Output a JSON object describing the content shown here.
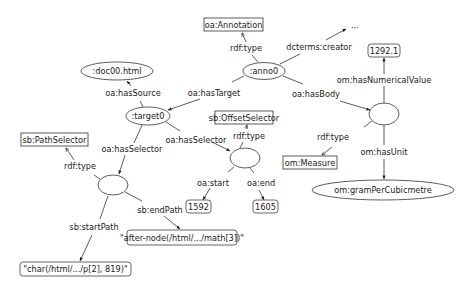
{
  "diagram": {
    "type": "rdf-graph",
    "nodes": {
      "annotation_class": {
        "label": "oa:Annotation",
        "shape": "rect"
      },
      "anno0": {
        "label": ":anno0",
        "shape": "ellipse"
      },
      "creator_ellipsis": {
        "label": "...",
        "shape": "text"
      },
      "numerical_value": {
        "label": "1292.1",
        "shape": "rounded-rect"
      },
      "body": {
        "label": "",
        "shape": "ellipse"
      },
      "measure_class": {
        "label": "om:Measure",
        "shape": "rect"
      },
      "unit": {
        "label": "om:gramPerCubicmetre",
        "shape": "ellipse"
      },
      "doc": {
        "label": ":doc00.html",
        "shape": "ellipse"
      },
      "target0": {
        "label": ":target0",
        "shape": "ellipse"
      },
      "offset_selector_class": {
        "label": "sb:OffsetSelector",
        "shape": "rect"
      },
      "offset_selector": {
        "label": "",
        "shape": "ellipse"
      },
      "start_value": {
        "label": "1592",
        "shape": "rounded-rect"
      },
      "end_value": {
        "label": "1605",
        "shape": "rounded-rect"
      },
      "path_selector_class": {
        "label": "sb:PathSelector",
        "shape": "rect"
      },
      "path_selector": {
        "label": "",
        "shape": "ellipse"
      },
      "end_path_value": {
        "label": "\"after-node(/html/.../math[3])\"",
        "shape": "rounded-rect"
      },
      "start_path_value": {
        "label": "\"char(/html/.../p[2], 819)\"",
        "shape": "rounded-rect"
      }
    },
    "edges": {
      "anno0_type": {
        "label": "rdf:type",
        "from": "anno0",
        "to": "annotation_class"
      },
      "anno0_creator": {
        "label": "dcterms:creator",
        "from": "anno0",
        "to": "creator_ellipsis"
      },
      "anno0_target": {
        "label": "oa:hasTarget",
        "from": "anno0",
        "to": "target0"
      },
      "anno0_body": {
        "label": "oa:hasBody",
        "from": "anno0",
        "to": "body"
      },
      "body_value": {
        "label": "om:hasNumericalValue",
        "from": "body",
        "to": "numerical_value"
      },
      "body_type": {
        "label": "rdf:type",
        "from": "body",
        "to": "measure_class"
      },
      "body_unit": {
        "label": "om:hasUnit",
        "from": "body",
        "to": "unit"
      },
      "target_source": {
        "label": "oa:hasSource",
        "from": "target0",
        "to": "doc"
      },
      "target_selector_offset": {
        "label": "oa:hasSelector",
        "from": "target0",
        "to": "offset_selector"
      },
      "target_selector_path": {
        "label": "oa:hasSelector",
        "from": "target0",
        "to": "path_selector"
      },
      "offset_type": {
        "label": "rdf:type",
        "from": "offset_selector",
        "to": "offset_selector_class"
      },
      "offset_start": {
        "label": "oa:start",
        "from": "offset_selector",
        "to": "start_value"
      },
      "offset_end": {
        "label": "oa:end",
        "from": "offset_selector",
        "to": "end_value"
      },
      "path_type": {
        "label": "rdf:type",
        "from": "path_selector",
        "to": "path_selector_class"
      },
      "path_start": {
        "label": "sb:startPath",
        "from": "path_selector",
        "to": "start_path_value"
      },
      "path_end": {
        "label": "sb:endPath",
        "from": "path_selector",
        "to": "end_path_value"
      }
    }
  }
}
